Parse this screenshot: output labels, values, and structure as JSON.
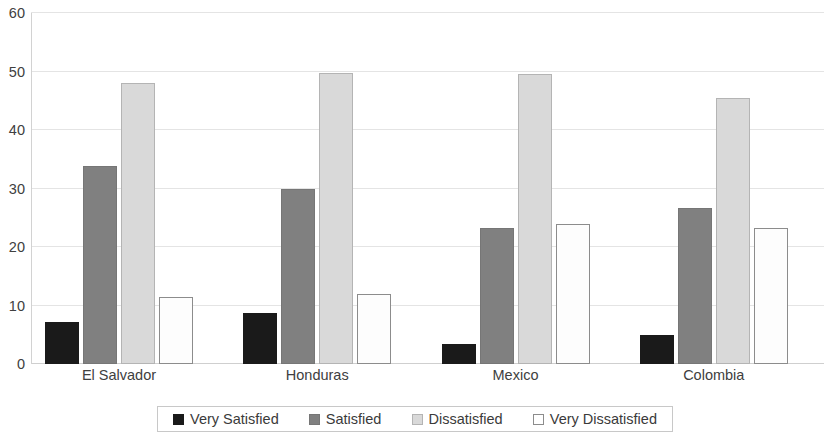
{
  "chart_data": {
    "type": "bar",
    "title": "",
    "subtitle": "",
    "xlabel": "",
    "ylabel": "",
    "categories": [
      "El Salvador",
      "Honduras",
      "Mexico",
      "Colombia"
    ],
    "series": [
      {
        "name": "Very Satisfied",
        "color": "#1a1a1a",
        "values": [
          7.2,
          8.8,
          3.5,
          5.0
        ]
      },
      {
        "name": "Satisfied",
        "color": "#808080",
        "values": [
          33.8,
          30.0,
          23.2,
          26.7
        ]
      },
      {
        "name": "Dissatisfied",
        "color": "#d9d9d9",
        "values": [
          48.0,
          49.8,
          49.5,
          45.5
        ]
      },
      {
        "name": "Very Dissatisfied",
        "color": "#ffffff",
        "values": [
          11.5,
          12.0,
          24.0,
          23.2
        ]
      }
    ],
    "ylim": [
      0,
      60
    ],
    "yticks": [
      0,
      10,
      20,
      30,
      40,
      50,
      60
    ],
    "ytick_labels": [
      "0",
      "10",
      "20",
      "30",
      "40",
      "50",
      "60"
    ],
    "grid": true,
    "grid_axis": "y",
    "legend_position": "bottom",
    "legend_border": true,
    "background": "#ffffff"
  }
}
